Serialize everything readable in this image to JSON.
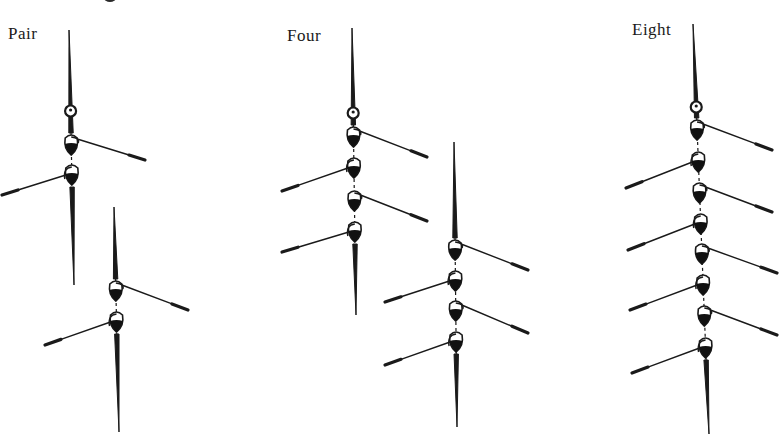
{
  "figure": {
    "type": "diagram",
    "colors": {
      "ink": "#1a1a1a",
      "background": "#ffffff"
    },
    "boats": [
      {
        "label": "Pair",
        "rowers": 2,
        "instances": [
          {
            "bow": [
              69,
              30
            ],
            "stern": [
              74,
              285
            ],
            "knob_y": 111,
            "rowers": [
              {
                "y": 143,
                "side": "right",
                "blade": [
                  145,
                  160
                ]
              },
              {
                "y": 173,
                "side": "left",
                "blade": [
                  2,
                  195
                ]
              }
            ]
          },
          {
            "bow": [
              114,
              207
            ],
            "stern": [
              119,
              432
            ],
            "knob_y": null,
            "rowers": [
              {
                "y": 289,
                "side": "right",
                "blade": [
                  188,
                  310
                ]
              },
              {
                "y": 320,
                "side": "left",
                "blade": [
                  45,
                  345
                ]
              }
            ]
          }
        ]
      },
      {
        "label": "Four",
        "rowers": 4,
        "instances": [
          {
            "bow": [
              352,
              28
            ],
            "stern": [
              356,
              315
            ],
            "knob_y": 113,
            "rowers": [
              {
                "y": 135,
                "side": "right",
                "blade": [
                  427,
                  157
                ]
              },
              {
                "y": 166,
                "side": "left",
                "blade": [
                  282,
                  191
                ]
              },
              {
                "y": 199,
                "side": "right",
                "blade": [
                  427,
                  221
                ]
              },
              {
                "y": 230,
                "side": "left",
                "blade": [
                  282,
                  252
                ]
              }
            ]
          },
          {
            "bow": [
              454,
              142
            ],
            "stern": [
              457,
              427
            ],
            "knob_y": null,
            "rowers": [
              {
                "y": 248,
                "side": "right",
                "blade": [
                  528,
                  270
                ]
              },
              {
                "y": 279,
                "side": "left",
                "blade": [
                  385,
                  302
                ]
              },
              {
                "y": 309,
                "side": "right",
                "blade": [
                  528,
                  333
                ]
              },
              {
                "y": 340,
                "side": "left",
                "blade": [
                  385,
                  365
                ]
              }
            ]
          }
        ]
      },
      {
        "label": "Eight",
        "rowers": 8,
        "instances": [
          {
            "bow": [
              693,
              24
            ],
            "stern": [
              709,
              434
            ],
            "knob_y": 107,
            "rowers": [
              {
                "y": 128,
                "side": "right",
                "blade": [
                  772,
                  150
                ]
              },
              {
                "y": 160,
                "side": "left",
                "blade": [
                  626,
                  188
                ]
              },
              {
                "y": 191,
                "side": "right",
                "blade": [
                  772,
                  212
                ]
              },
              {
                "y": 222,
                "side": "left",
                "blade": [
                  628,
                  250
                ]
              },
              {
                "y": 252,
                "side": "right",
                "blade": [
                  777,
                  273
                ]
              },
              {
                "y": 283,
                "side": "left",
                "blade": [
                  630,
                  310
                ]
              },
              {
                "y": 314,
                "side": "right",
                "blade": [
                  777,
                  335
                ]
              },
              {
                "y": 346,
                "side": "left",
                "blade": [
                  632,
                  373
                ]
              }
            ]
          }
        ]
      }
    ]
  },
  "labels": {
    "pair": "Pair",
    "four": "Four",
    "eight": "Eight"
  }
}
